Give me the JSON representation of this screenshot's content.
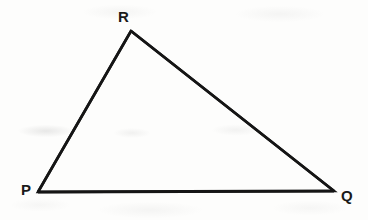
{
  "figure": {
    "name": "triangle-pqr",
    "background_color": "#fdfdfc",
    "stroke_color": "#151515",
    "stroke_width": 2.6,
    "canvas": {
      "width": 368,
      "height": 220
    }
  },
  "labels": {
    "r": "R",
    "p": "P",
    "q": "Q"
  },
  "vertices": [
    {
      "id": "P",
      "label": "P",
      "x": 38,
      "y": 192
    },
    {
      "id": "R",
      "label": "R",
      "x": 131,
      "y": 31
    },
    {
      "id": "Q",
      "label": "Q",
      "x": 334,
      "y": 191
    }
  ],
  "edges": [
    {
      "id": "PR",
      "from": "P",
      "to": "R"
    },
    {
      "id": "RQ",
      "from": "R",
      "to": "Q"
    },
    {
      "id": "PQ",
      "from": "P",
      "to": "Q"
    }
  ],
  "label_positions": {
    "r": {
      "x": 118,
      "y": 9
    },
    "p": {
      "x": 21,
      "y": 182
    },
    "q": {
      "x": 341,
      "y": 188
    }
  }
}
